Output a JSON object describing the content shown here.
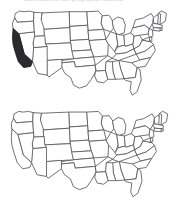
{
  "page": {
    "title_partial": "illustration of the geographic location",
    "background_color": "#ffffff"
  },
  "maps": [
    {
      "id": "map-highlighted",
      "name": "us-map-california-highlighted",
      "caption": "",
      "outline_color": "#585860",
      "fill_color": "#ffffff",
      "highlight_color": "#2b2b2e",
      "highlighted_states": [
        "California"
      ],
      "region": "Contiguous United States"
    },
    {
      "id": "map-blank",
      "name": "us-map-blank",
      "caption": "",
      "outline_color": "#585860",
      "fill_color": "#ffffff",
      "highlight_color": "#2b2b2e",
      "highlighted_states": [],
      "region": "Contiguous United States"
    }
  ]
}
